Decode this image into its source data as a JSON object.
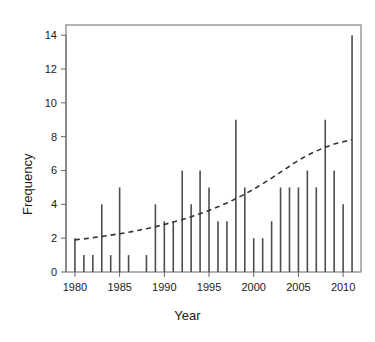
{
  "chart_data": {
    "type": "bar",
    "title": "",
    "xlabel": "Year",
    "ylabel": "Frequency",
    "xlim": [
      1979.0,
      2012.0
    ],
    "ylim": [
      0,
      14.6
    ],
    "grid": false,
    "legend": null,
    "x_ticks": [
      1980,
      1985,
      1990,
      1995,
      2000,
      2005,
      2010
    ],
    "x_tick_labels": [
      "1980",
      "1985",
      "1990",
      "1995",
      "2000",
      "2005",
      "2010"
    ],
    "y_ticks": [
      0,
      2,
      4,
      6,
      8,
      10,
      12,
      14
    ],
    "y_tick_labels": [
      "0",
      "2",
      "4",
      "6",
      "8",
      "10",
      "12",
      "14"
    ],
    "categories": [
      1980,
      1981,
      1982,
      1983,
      1984,
      1985,
      1986,
      1987,
      1988,
      1989,
      1990,
      1991,
      1992,
      1993,
      1994,
      1995,
      1996,
      1997,
      1998,
      1999,
      2000,
      2001,
      2002,
      2003,
      2004,
      2005,
      2006,
      2007,
      2008,
      2009,
      2010,
      2011
    ],
    "values": [
      2,
      1,
      1,
      4,
      1,
      5,
      1,
      0,
      1,
      4,
      3,
      3,
      6,
      4,
      6,
      5,
      3,
      3,
      9,
      5,
      2,
      2,
      3,
      5,
      5,
      5,
      6,
      5,
      9,
      6,
      4,
      14
    ],
    "bar_color": "#4d4d4d",
    "axis_color": "#666666",
    "text_color": "#1a1a1a",
    "annotations": [
      {
        "name": "trend-line",
        "style": "dashed",
        "color": "#333333",
        "x": [
          1980,
          1981,
          1982,
          1983,
          1984,
          1985,
          1986,
          1987,
          1988,
          1989,
          1990,
          1991,
          1992,
          1993,
          1994,
          1995,
          1996,
          1997,
          1998,
          1999,
          2000,
          2001,
          2002,
          2003,
          2004,
          2005,
          2006,
          2007,
          2008,
          2009,
          2010,
          2011
        ],
        "y": [
          1.9,
          1.96,
          2.03,
          2.1,
          2.18,
          2.26,
          2.35,
          2.45,
          2.56,
          2.68,
          2.81,
          2.95,
          3.1,
          3.27,
          3.45,
          3.64,
          3.85,
          4.08,
          4.33,
          4.6,
          4.9,
          5.21,
          5.55,
          5.9,
          6.25,
          6.6,
          6.9,
          7.15,
          7.38,
          7.56,
          7.7,
          7.82
        ]
      }
    ]
  }
}
